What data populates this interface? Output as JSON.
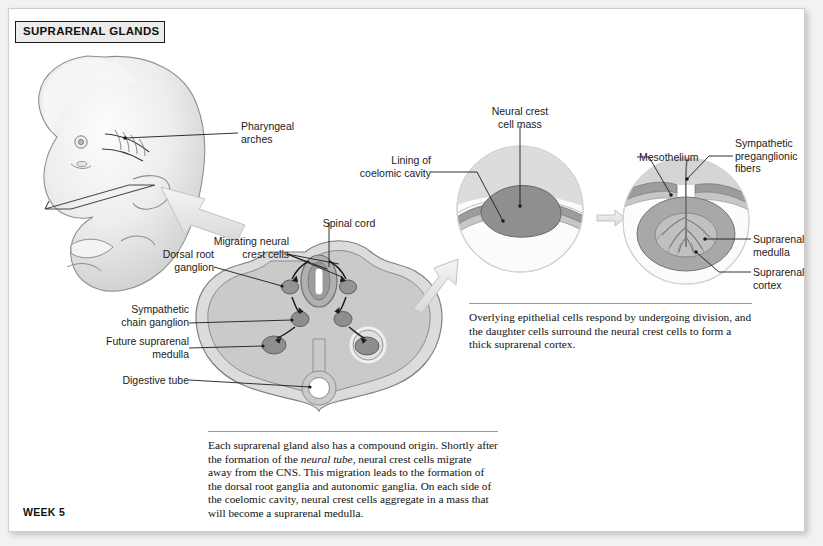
{
  "header": {
    "title": "SUPRARENAL GLANDS"
  },
  "footer": {
    "stage": "WEEK 5"
  },
  "figure": {
    "embryo_labels": [
      {
        "id": "pharyngeal-arches",
        "text": "Pharyngeal\narches"
      }
    ],
    "cross_section_labels": [
      {
        "id": "spinal-cord",
        "text": "Spinal cord"
      },
      {
        "id": "migrating-neural-crest-cells",
        "text": "Migrating neural\ncrest cells"
      },
      {
        "id": "dorsal-root-ganglion",
        "text": "Dorsal root\nganglion"
      },
      {
        "id": "sympathetic-chain-ganglion",
        "text": "Sympathetic\nchain ganglion"
      },
      {
        "id": "future-suprarenal-medulla",
        "text": "Future suprarenal\nmedulla"
      },
      {
        "id": "digestive-tube",
        "text": "Digestive tube"
      }
    ],
    "middle_detail_labels": [
      {
        "id": "neural-crest-cell-mass",
        "text": "Neural crest\ncell mass"
      },
      {
        "id": "lining-of-coelomic-cavity",
        "text": "Lining of\ncoelomic cavity"
      }
    ],
    "right_detail_labels": [
      {
        "id": "mesothelium",
        "text": "Mesothelium"
      },
      {
        "id": "sympathetic-preganglionic-fibers",
        "text": "Sympathetic\npreganglionic\nfibers"
      },
      {
        "id": "suprarenal-medulla",
        "text": "Suprarenal\nmedulla"
      },
      {
        "id": "suprarenal-cortex",
        "text": "Suprarenal\ncortex"
      }
    ]
  },
  "captions": {
    "right": "Overlying epithelial cells respond by undergoing division, and the daughter cells surround the neural crest cells to form a thick suprarenal cortex.",
    "bottom_part1": "Each suprarenal gland also has a compound origin. Shortly after the formation of the ",
    "bottom_italic": "neural tube",
    "bottom_part2": ", neural crest cells migrate away from the CNS. This migration leads to the formation of the dorsal root ganglia and autonomic ganglia. On each side of the coelomic cavity, neural crest cells aggregate in a mass that will become a suprarenal medulla."
  },
  "colors": {
    "page_background": "#ffffff",
    "canvas_background": "#f2f2f2",
    "header_fill": "#ebebeb",
    "tissue_light": "#d7d7d7",
    "tissue_mid": "#b3b3b3",
    "tissue_dark": "#8a8a8a",
    "outline": "#5a5a5a",
    "text": "#1b1b1b",
    "arrow_fill": "#e8e8e8"
  }
}
